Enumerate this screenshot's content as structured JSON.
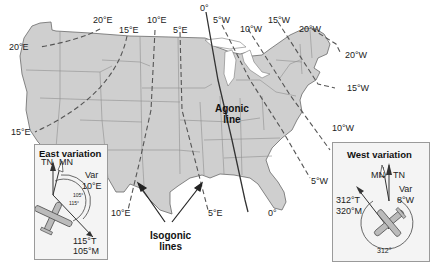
{
  "map": {
    "title": "Isogonic lines of magnetic variation over the contiguous United States",
    "colors": {
      "land": "#cfcfcf",
      "state_borders": "#8e8e8e",
      "coast": "#6a6a6a",
      "isogonic_dashed": "#555555",
      "agonic": "#333333",
      "background": "#ffffff"
    },
    "isogonic_labels": {
      "top_20E": "20°E",
      "top_15E": "15°E",
      "top_10E": "10°E",
      "top_5E": "5°E",
      "top_0": "0°",
      "top_5W": "5°W",
      "top_10W": "10°W",
      "top_15W": "15°W",
      "top_20W": "20°W",
      "left_20E": "20°E",
      "left_15E": "15°E",
      "right_20W": "20°W",
      "right_15W": "15°W",
      "right_10W": "10°W",
      "right_5W": "5°W",
      "bottom_10E": "10°E",
      "bottom_5E": "5°E",
      "bottom_0": "0°"
    },
    "annotations": {
      "agonic_line_1": "Agonic",
      "agonic_line_2": "line",
      "isogonic_lines_1": "Isogonic",
      "isogonic_lines_2": "lines"
    }
  },
  "east_inset": {
    "title": "East variation",
    "tn": "TN",
    "mn": "MN",
    "var_label": "Var",
    "var_value": "10°E",
    "angle_magnetic": "105°",
    "angle_true": "115°",
    "course_true": "115°T",
    "course_magnetic": "105°M"
  },
  "west_inset": {
    "title": "West variation",
    "tn": "TN",
    "mn": "MN",
    "var_label": "Var",
    "var_value": "8°W",
    "course_true": "312°T",
    "course_magnetic": "320°M",
    "angle_true": "312°"
  }
}
